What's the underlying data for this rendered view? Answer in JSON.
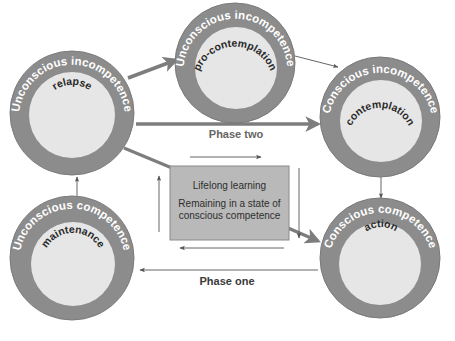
{
  "colors": {
    "ring": "#8c8c8c",
    "ring_edge": "#7a7a7a",
    "inner": "#e6e6e6",
    "box_fill": "#b9b9b9",
    "box_edge": "#8a8a8a",
    "arrow_thick": "#7d7d7d",
    "arrow_thin": "#555555"
  },
  "nodes": [
    {
      "id": "relapse",
      "ring_label": "Unconscious incompetence",
      "stage": "relapse"
    },
    {
      "id": "pro-contemplation",
      "ring_label": "Unconscious incompetence",
      "stage": "pro-contemplation"
    },
    {
      "id": "contemplation",
      "ring_label": "Conscious incompetence",
      "stage": "contemplation"
    },
    {
      "id": "maintenance",
      "ring_label": "Unconscious competence",
      "stage": "maintenance"
    },
    {
      "id": "action",
      "ring_label": "Conscious competence",
      "stage": "action"
    }
  ],
  "center_box": {
    "title": "Lifelong learning",
    "line1": "Remaining in a state of",
    "line2": "conscious competence"
  },
  "phases": {
    "two": "Phase two",
    "one": "Phase one"
  }
}
